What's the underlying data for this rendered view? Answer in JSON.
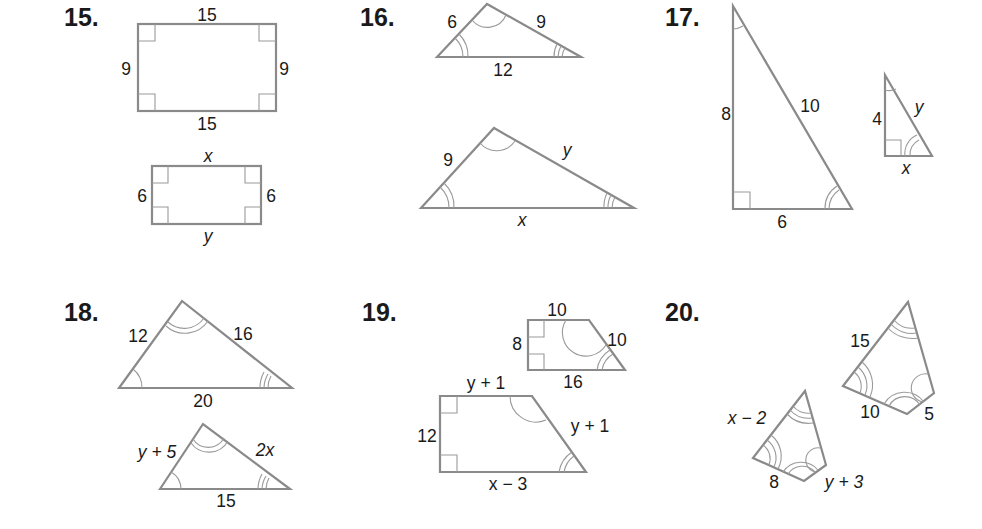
{
  "problems": [
    {
      "number": "15.",
      "figure": "rectangles",
      "large": {
        "top": "15",
        "bottom": "15",
        "left": "9",
        "right": "9"
      },
      "small": {
        "top": "x",
        "bottom": "y",
        "left": "6",
        "right": "6"
      }
    },
    {
      "number": "16.",
      "figure": "triangles",
      "large": {
        "left": "6",
        "right": "9",
        "base": "12"
      },
      "small": {
        "left": "9",
        "right": "y",
        "base": "x"
      }
    },
    {
      "number": "17.",
      "figure": "right-triangles",
      "large": {
        "leg_vertical": "8",
        "hypotenuse": "10",
        "leg_horizontal": "6"
      },
      "small": {
        "leg_vertical": "4",
        "hypotenuse": "y",
        "leg_horizontal": "x"
      }
    },
    {
      "number": "18.",
      "figure": "triangles",
      "large": {
        "left": "12",
        "right": "16",
        "base": "20"
      },
      "small": {
        "left": "y + 5",
        "right": "2x",
        "base": "15"
      }
    },
    {
      "number": "19.",
      "figure": "trapezoids",
      "small": {
        "top": "10",
        "left": "8",
        "slant": "10",
        "bottom": "16"
      },
      "large": {
        "top": "y + 1",
        "left": "12",
        "slant": "y + 1",
        "bottom": "x − 3"
      }
    },
    {
      "number": "20.",
      "figure": "quadrilaterals",
      "large": {
        "left": "15",
        "bottom": "10",
        "right": "5"
      },
      "small": {
        "left": "x − 2",
        "bottom": "8",
        "right": "y + 3"
      }
    }
  ]
}
